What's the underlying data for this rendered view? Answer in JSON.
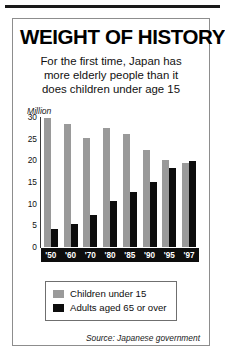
{
  "graphic": {
    "title": "WEIGHT OF HISTORY",
    "subtitle_lines": [
      "For the first time, Japan has",
      "more elderly people than it",
      "does children under age 15"
    ],
    "unit_label": "Million",
    "source": "Source: Japanese government"
  },
  "legend": {
    "items": [
      {
        "label": "Children under 15",
        "color": "#9a9a9a"
      },
      {
        "label": "Adults aged  65 or over",
        "color": "#0d0d0d"
      }
    ]
  },
  "chart_data": {
    "type": "bar",
    "title": "WEIGHT OF HISTORY",
    "subtitle": "For the first time, Japan has more elderly people than it does children under age 15",
    "xlabel": "",
    "ylabel": "Million",
    "ylim": [
      0,
      30
    ],
    "yticks": [
      0,
      5,
      10,
      15,
      20,
      25,
      30
    ],
    "grid": false,
    "legend_position": "bottom",
    "categories": [
      "'50",
      "'60",
      "'70",
      "'80",
      "'85",
      "'90",
      "'95",
      "'97"
    ],
    "series": [
      {
        "name": "Children under 15",
        "color": "#9a9a9a",
        "values": [
          29.8,
          28.4,
          25.2,
          27.5,
          26.0,
          22.5,
          20.0,
          19.5
        ]
      },
      {
        "name": "Adults aged  65 or over",
        "color": "#0d0d0d",
        "values": [
          4.1,
          5.4,
          7.3,
          10.6,
          12.7,
          14.9,
          18.3,
          19.9
        ]
      }
    ],
    "source": "Source: Japanese government"
  }
}
